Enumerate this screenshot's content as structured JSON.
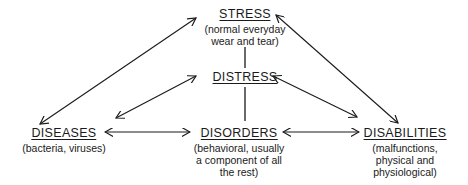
{
  "diagram": {
    "nodes": {
      "stress": {
        "title": "STRESS",
        "subtitle": [
          "(normal everyday",
          "wear and tear)"
        ]
      },
      "distress": {
        "title": "DISTRESS",
        "subtitle": []
      },
      "diseases": {
        "title": "DISEASES",
        "subtitle": [
          "(bacteria, viruses)"
        ]
      },
      "disorders": {
        "title": "DISORDERS",
        "subtitle": [
          "(behavioral, usually",
          "a component of all",
          "the rest)"
        ]
      },
      "disabilities": {
        "title": "DISABILITIES",
        "subtitle": [
          "(malfunctions,",
          "physical and",
          "physiological)"
        ]
      }
    },
    "edges": [
      {
        "from": "stress",
        "to": "distress",
        "type": "line"
      },
      {
        "from": "distress",
        "to": "disorders",
        "type": "line"
      },
      {
        "from": "stress",
        "to": "diseases",
        "type": "double-arrow"
      },
      {
        "from": "stress",
        "to": "disabilities",
        "type": "double-arrow"
      },
      {
        "from": "distress",
        "to": "diseases",
        "type": "double-arrow"
      },
      {
        "from": "distress",
        "to": "disabilities",
        "type": "double-arrow"
      },
      {
        "from": "diseases",
        "to": "disorders",
        "type": "double-arrow"
      },
      {
        "from": "disorders",
        "to": "disabilities",
        "type": "double-arrow"
      }
    ],
    "colors": {
      "ink": "#1a1a1a",
      "background": "#ffffff"
    }
  }
}
